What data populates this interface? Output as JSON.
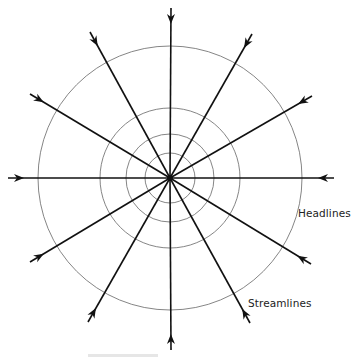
{
  "diagram": {
    "type": "flow-net-radial-sink",
    "center": [
      170,
      178
    ],
    "headlines": {
      "label": "Headlines",
      "radii": [
        25,
        44,
        70,
        132
      ],
      "stroke": "#777777"
    },
    "streamlines": {
      "label": "Streamlines",
      "count": 12,
      "direction": "inward",
      "stroke": "#111111",
      "endpoints": [
        [
          171,
          8
        ],
        [
          252,
          34
        ],
        [
          312,
          96
        ],
        [
          334,
          178
        ],
        [
          311,
          264
        ],
        [
          250,
          323
        ],
        [
          171,
          350
        ],
        [
          88,
          322
        ],
        [
          30,
          262
        ],
        [
          8,
          178
        ],
        [
          30,
          94
        ],
        [
          90,
          32
        ]
      ]
    }
  }
}
